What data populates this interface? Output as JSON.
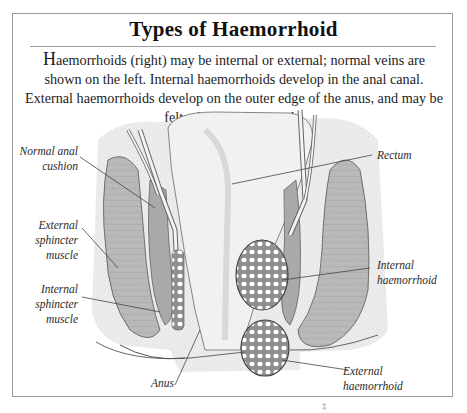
{
  "figure": {
    "title": "Types of Haemorrhoid",
    "intro_initial": "H",
    "intro_text": "aemorrhoids (right) may be internal or external; normal veins are shown on the left. Internal haemorrhoids develop in the anal canal. External haemorrhoids develop on the outer edge of the anus, and may be felt when passing stools.",
    "labels": {
      "normal_anal_cushion": [
        "Normal anal",
        "cushion"
      ],
      "external_sphincter": [
        "External",
        "sphincter",
        "muscle"
      ],
      "internal_sphincter": [
        "Internal",
        "sphincter",
        "muscle"
      ],
      "anus": "Anus",
      "rectum": "Rectum",
      "internal_haemorrhoid": [
        "Internal",
        "haemorrhoid"
      ],
      "external_haemorrhoid": [
        "External",
        "haemorrhoid"
      ]
    },
    "footer_mark": "‡",
    "colors": {
      "frame": "#9a9a9a",
      "muscle": "#b8b8b8",
      "tissue": "#e4e4e4",
      "outline": "#555555",
      "leader": "#444444"
    }
  }
}
